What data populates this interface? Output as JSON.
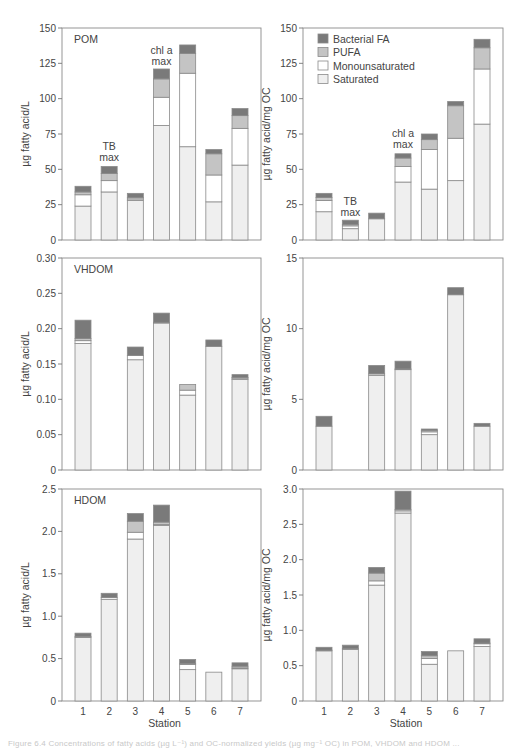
{
  "figure": {
    "caption": "Figure 6.4  Concentrations of fatty acids (µg L⁻¹) and OC-normalized yields (µg mg⁻¹ OC) in POM, VHDOM and HDOM ...",
    "x_axis_label": "Station",
    "legend": [
      {
        "key": "bacterial",
        "label": "Bacterial FA",
        "color": "#7a7a7a"
      },
      {
        "key": "pufa",
        "label": "PUFA",
        "color": "#c4c4c4"
      },
      {
        "key": "mono",
        "label": "Monounsaturated",
        "color": "#ffffff"
      },
      {
        "key": "sat",
        "label": "Saturated",
        "color": "#efefef"
      }
    ],
    "colors": {
      "axis": "#777777",
      "bar_edge": "#8a8a8a",
      "text": "#444444"
    }
  },
  "chart_data": [
    {
      "type": "bar",
      "stacked": true,
      "panel": "top-left",
      "title": "POM",
      "xlabel": "",
      "ylabel": "µg fatty acid/L",
      "ylim": [
        0,
        150
      ],
      "yticks": [
        0,
        25,
        50,
        75,
        100,
        125,
        150
      ],
      "ytick_labels": [
        "0",
        "25",
        "50",
        "75",
        "100",
        "125",
        "150"
      ],
      "categories": [
        "1",
        "2",
        "3",
        "4",
        "5",
        "6",
        "7"
      ],
      "series": [
        {
          "name": "Saturated",
          "values": [
            24,
            34,
            28,
            81,
            66,
            27,
            53
          ]
        },
        {
          "name": "Monounsaturated",
          "values": [
            8,
            8,
            1,
            20,
            52,
            19,
            26
          ]
        },
        {
          "name": "PUFA",
          "values": [
            2,
            5,
            1,
            13,
            14,
            15,
            9
          ]
        },
        {
          "name": "Bacterial FA",
          "values": [
            4,
            5,
            3,
            7,
            6,
            3,
            5
          ]
        }
      ],
      "annotations": [
        {
          "text": [
            "TB",
            "max"
          ],
          "station": "2",
          "y": 53
        },
        {
          "text": [
            "chl a",
            "max"
          ],
          "station": "4",
          "y": 121
        }
      ]
    },
    {
      "type": "bar",
      "stacked": true,
      "panel": "top-right",
      "title": "",
      "xlabel": "",
      "ylabel": "µg fatty acid/mg OC",
      "ylim": [
        0,
        150
      ],
      "yticks": [
        0,
        25,
        50,
        75,
        100,
        125,
        150
      ],
      "ytick_labels": [
        "0",
        "25",
        "50",
        "75",
        "100",
        "125",
        "150"
      ],
      "categories": [
        "1",
        "2",
        "3",
        "4",
        "5",
        "6",
        "7"
      ],
      "series": [
        {
          "name": "Saturated",
          "values": [
            20,
            8,
            15,
            41,
            36,
            42,
            82
          ]
        },
        {
          "name": "Monounsaturated",
          "values": [
            8,
            2,
            0,
            11,
            28,
            30,
            39
          ]
        },
        {
          "name": "PUFA",
          "values": [
            2,
            1,
            0,
            6,
            7,
            23,
            15
          ]
        },
        {
          "name": "Bacterial FA",
          "values": [
            3,
            3,
            4,
            3,
            4,
            3,
            6
          ]
        }
      ],
      "legend_position": "upper left",
      "annotations": [
        {
          "text": [
            "TB",
            "max"
          ],
          "station": "2",
          "y": 14
        },
        {
          "text": [
            "chl a",
            "max"
          ],
          "station": "4",
          "y": 62
        }
      ]
    },
    {
      "type": "bar",
      "stacked": true,
      "panel": "middle-left",
      "title": "VHDOM",
      "xlabel": "",
      "ylabel": "µg fatty acid/L",
      "ylim": [
        0,
        0.3
      ],
      "yticks": [
        0,
        0.05,
        0.1,
        0.15,
        0.2,
        0.25,
        0.3
      ],
      "ytick_labels": [
        "0",
        "0.05",
        "0.10",
        "0.15",
        "0.20",
        "0.25",
        "0.30"
      ],
      "categories": [
        "1",
        "2",
        "3",
        "4",
        "5",
        "6",
        "7"
      ],
      "series": [
        {
          "name": "Saturated",
          "values": [
            0.179,
            0,
            0.156,
            0.208,
            0.106,
            0.175,
            0.128
          ]
        },
        {
          "name": "Monounsaturated",
          "values": [
            0.004,
            0,
            0.006,
            0,
            0.007,
            0,
            0.002
          ]
        },
        {
          "name": "PUFA",
          "values": [
            0.003,
            0,
            0,
            0.001,
            0.008,
            0,
            0.001
          ]
        },
        {
          "name": "Bacterial FA",
          "values": [
            0.026,
            0,
            0.012,
            0.013,
            0,
            0.009,
            0.004
          ]
        }
      ]
    },
    {
      "type": "bar",
      "stacked": true,
      "panel": "middle-right",
      "title": "",
      "xlabel": "",
      "ylabel": "µg fatty acid/mg OC",
      "ylim": [
        0,
        15
      ],
      "yticks": [
        0,
        5,
        10,
        15
      ],
      "ytick_labels": [
        "0",
        "5",
        "10",
        "15"
      ],
      "categories": [
        "1",
        "2",
        "3",
        "4",
        "5",
        "6",
        "7"
      ],
      "series": [
        {
          "name": "Saturated",
          "values": [
            3.1,
            0,
            6.7,
            7.1,
            2.5,
            12.4,
            3.1
          ]
        },
        {
          "name": "Monounsaturated",
          "values": [
            0,
            0,
            0.1,
            0,
            0.2,
            0,
            0
          ]
        },
        {
          "name": "PUFA",
          "values": [
            0,
            0,
            0,
            0.05,
            0.1,
            0,
            0
          ]
        },
        {
          "name": "Bacterial FA",
          "values": [
            0.7,
            0,
            0.6,
            0.55,
            0.1,
            0.5,
            0.2
          ]
        }
      ]
    },
    {
      "type": "bar",
      "stacked": true,
      "panel": "bottom-left",
      "title": "HDOM",
      "xlabel": "Station",
      "ylabel": "µg fatty acid/L",
      "ylim": [
        0,
        2.5
      ],
      "yticks": [
        0,
        0.5,
        1.0,
        1.5,
        2.0,
        2.5
      ],
      "ytick_labels": [
        "0",
        "0.5",
        "1.0",
        "1.5",
        "2.0",
        "2.5"
      ],
      "categories": [
        "1",
        "2",
        "3",
        "4",
        "5",
        "6",
        "7"
      ],
      "series": [
        {
          "name": "Saturated",
          "values": [
            0.75,
            1.2,
            1.91,
            2.07,
            0.37,
            0.34,
            0.38
          ]
        },
        {
          "name": "Monounsaturated",
          "values": [
            0,
            0.02,
            0.08,
            0.01,
            0.06,
            0,
            0.01
          ]
        },
        {
          "name": "PUFA",
          "values": [
            0.01,
            0,
            0.13,
            0.03,
            0.01,
            0,
            0.02
          ]
        },
        {
          "name": "Bacterial FA",
          "values": [
            0.04,
            0.05,
            0.09,
            0.2,
            0.05,
            0,
            0.04
          ]
        }
      ]
    },
    {
      "type": "bar",
      "stacked": true,
      "panel": "bottom-right",
      "title": "",
      "xlabel": "Station",
      "ylabel": "µg fatty acid/mg OC",
      "ylim": [
        0,
        3.0
      ],
      "yticks": [
        0,
        0.5,
        1.0,
        1.5,
        2.0,
        2.5,
        3.0
      ],
      "ytick_labels": [
        "0",
        "0.5",
        "1.0",
        "1.5",
        "2.0",
        "2.5",
        "3.0"
      ],
      "categories": [
        "1",
        "2",
        "3",
        "4",
        "5",
        "6",
        "7"
      ],
      "series": [
        {
          "name": "Saturated",
          "values": [
            0.71,
            0.73,
            1.64,
            2.66,
            0.52,
            0.71,
            0.77
          ]
        },
        {
          "name": "Monounsaturated",
          "values": [
            0,
            0.01,
            0.06,
            0.03,
            0.08,
            0,
            0.04
          ]
        },
        {
          "name": "PUFA",
          "values": [
            0.01,
            0,
            0.11,
            0.02,
            0.04,
            0,
            0.01
          ]
        },
        {
          "name": "Bacterial FA",
          "values": [
            0.04,
            0.05,
            0.08,
            0.26,
            0.06,
            0,
            0.06
          ]
        }
      ]
    }
  ]
}
